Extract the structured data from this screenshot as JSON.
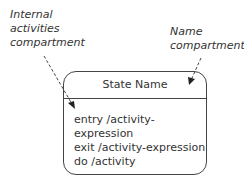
{
  "annotations": {
    "internal_activities": [
      "Internal",
      "activities",
      "compartment"
    ],
    "name_compartment": [
      "Name",
      "compartment"
    ]
  },
  "state": {
    "name": "State Name",
    "activities": [
      "entry /activity-expression",
      "exit /activity-expression",
      "do /activity"
    ]
  },
  "colors": {
    "line": "#444444",
    "text": "#333333",
    "background": "#ffffff"
  }
}
